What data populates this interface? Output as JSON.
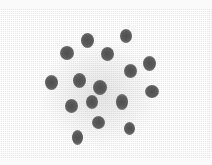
{
  "image": {
    "description": "Grayscale photograph of dark dots on woven mesh fabric",
    "background_color": "#ececec",
    "dot_color": "#5a5a5a",
    "dots": [
      {
        "x": 87,
        "y": 40,
        "w": 13,
        "h": 15
      },
      {
        "x": 126,
        "y": 36,
        "w": 12,
        "h": 14
      },
      {
        "x": 67,
        "y": 53,
        "w": 14,
        "h": 14
      },
      {
        "x": 107,
        "y": 54,
        "w": 13,
        "h": 14
      },
      {
        "x": 149,
        "y": 63,
        "w": 13,
        "h": 15
      },
      {
        "x": 130,
        "y": 71,
        "w": 13,
        "h": 14
      },
      {
        "x": 51,
        "y": 82,
        "w": 13,
        "h": 15
      },
      {
        "x": 79,
        "y": 80,
        "w": 13,
        "h": 15
      },
      {
        "x": 100,
        "y": 87,
        "w": 14,
        "h": 15
      },
      {
        "x": 152,
        "y": 91,
        "w": 14,
        "h": 13
      },
      {
        "x": 71,
        "y": 106,
        "w": 13,
        "h": 14
      },
      {
        "x": 92,
        "y": 102,
        "w": 12,
        "h": 14
      },
      {
        "x": 122,
        "y": 102,
        "w": 12,
        "h": 16
      },
      {
        "x": 98,
        "y": 122,
        "w": 13,
        "h": 13
      },
      {
        "x": 129,
        "y": 128,
        "w": 11,
        "h": 13
      },
      {
        "x": 77,
        "y": 137,
        "w": 11,
        "h": 15
      }
    ]
  }
}
